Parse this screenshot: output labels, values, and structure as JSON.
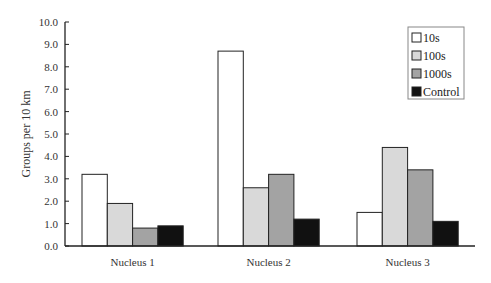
{
  "chart_data": {
    "type": "bar",
    "title": "",
    "xlabel": "",
    "ylabel": "Groups per 10 km",
    "ylim": [
      0,
      10
    ],
    "yticks": [
      "0.0",
      "1.0",
      "2.0",
      "3.0",
      "4.0",
      "5.0",
      "6.0",
      "7.0",
      "8.0",
      "9.0",
      "10.0"
    ],
    "categories": [
      "Nucleus 1",
      "Nucleus 2",
      "Nucleus 3"
    ],
    "series": [
      {
        "name": "10s",
        "color": "#ffffff",
        "values": [
          3.2,
          8.7,
          1.5
        ]
      },
      {
        "name": "100s",
        "color": "#d9d9d9",
        "values": [
          1.9,
          2.6,
          4.4
        ]
      },
      {
        "name": "1000s",
        "color": "#a3a3a3",
        "values": [
          0.8,
          3.2,
          3.4
        ]
      },
      {
        "name": "Control",
        "color": "#111111",
        "values": [
          0.9,
          1.2,
          1.1
        ]
      }
    ],
    "grid": false,
    "legend_position": "top-right"
  }
}
